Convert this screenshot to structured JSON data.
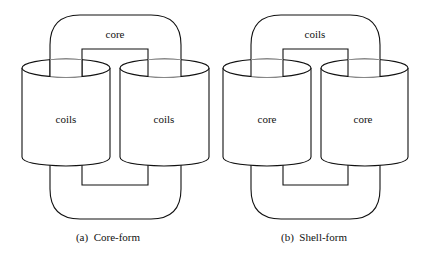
{
  "diagrams": [
    {
      "id": "a",
      "caption": "(a)  Core-form",
      "loop_label": "core",
      "left_cylinder_label": "coils",
      "right_cylinder_label": "coils"
    },
    {
      "id": "b",
      "caption": "(b)  Shell-form",
      "loop_label": "coils",
      "left_cylinder_label": "core",
      "right_cylinder_label": "core"
    }
  ]
}
